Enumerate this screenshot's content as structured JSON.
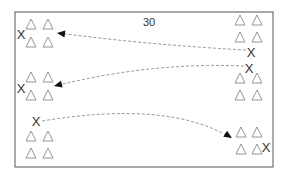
{
  "diagram": {
    "title_number": "30",
    "colors": {
      "frame": "#555555",
      "triangle": "#8a8a8a",
      "x_marker": "#333333",
      "path": "#888888",
      "arrowhead": "#111111"
    },
    "frame": {
      "x": 15,
      "y": 12,
      "w": 258,
      "h": 155
    },
    "triangles": [
      {
        "x": 31,
        "y": 24
      },
      {
        "x": 48,
        "y": 24
      },
      {
        "x": 31,
        "y": 42
      },
      {
        "x": 48,
        "y": 42
      },
      {
        "x": 31,
        "y": 77
      },
      {
        "x": 48,
        "y": 77
      },
      {
        "x": 31,
        "y": 95
      },
      {
        "x": 48,
        "y": 95
      },
      {
        "x": 31,
        "y": 136
      },
      {
        "x": 48,
        "y": 136
      },
      {
        "x": 31,
        "y": 153
      },
      {
        "x": 48,
        "y": 153
      },
      {
        "x": 240,
        "y": 20
      },
      {
        "x": 257,
        "y": 20
      },
      {
        "x": 240,
        "y": 37
      },
      {
        "x": 257,
        "y": 37
      },
      {
        "x": 240,
        "y": 78
      },
      {
        "x": 257,
        "y": 78
      },
      {
        "x": 240,
        "y": 95
      },
      {
        "x": 257,
        "y": 95
      },
      {
        "x": 241,
        "y": 132
      },
      {
        "x": 257,
        "y": 132
      },
      {
        "x": 241,
        "y": 149
      },
      {
        "x": 257,
        "y": 149
      }
    ],
    "x_markers": [
      {
        "label": "X",
        "x": 21,
        "y": 34
      },
      {
        "label": "X",
        "x": 21,
        "y": 88
      },
      {
        "label": "X",
        "x": 36,
        "y": 121
      },
      {
        "label": "X",
        "x": 251,
        "y": 52
      },
      {
        "label": "X",
        "x": 249,
        "y": 68
      },
      {
        "label": "X",
        "x": 266,
        "y": 147
      }
    ],
    "paths": [
      {
        "from": "right-x-52",
        "to": "left-group-1",
        "d": "M 246 50 Q 150 45 58 33",
        "arrow": [
          57,
          33
        ]
      },
      {
        "from": "right-x-68",
        "to": "left-group-2",
        "d": "M 244 66 Q 150 62 55 86",
        "arrow": [
          54,
          86
        ]
      },
      {
        "from": "left-x-121",
        "to": "right-group-bottom",
        "d": "M 42 121 Q 170 100 231 138",
        "arrow": [
          232,
          138
        ]
      }
    ]
  }
}
